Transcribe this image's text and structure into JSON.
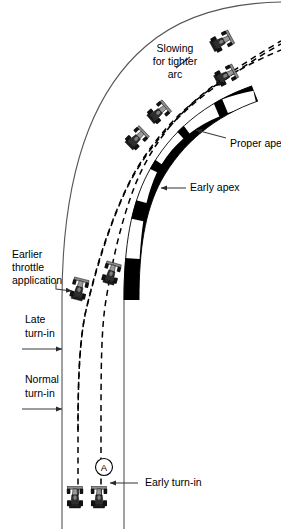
{
  "diagram": {
    "type": "technical-illustration",
    "background_color": "#ffffff",
    "line_color": "#000000",
    "track_edge_color": "#55545a"
  },
  "labels": {
    "slowing": {
      "line1": "Slowing",
      "line2": "for tighter",
      "line3": "arc"
    },
    "proper_apex": "Proper apex",
    "early_apex": "Early apex",
    "earlier_throttle": {
      "line1": "Earlier",
      "line2": "throttle",
      "line3": "application"
    },
    "late_turn_in": {
      "line1": "Late",
      "line2": "turn-in"
    },
    "normal_turn_in": {
      "line1": "Normal",
      "line2": "turn-in"
    },
    "early_turn_in": "Early turn-in",
    "marker_a": "A"
  },
  "elements": {
    "track_outer_edge": "outer-track-boundary",
    "track_inner_edge": "inner-track-boundary",
    "curb": "checkered-apex-curb",
    "racing_lines": [
      {
        "name": "early-apex-line",
        "style": "dashed"
      },
      {
        "name": "normal-line",
        "style": "dashed"
      },
      {
        "name": "late-apex-line",
        "style": "dashed"
      }
    ],
    "cars": [
      {
        "name": "car-start-left",
        "position": "bottom-left"
      },
      {
        "name": "car-start-right",
        "position": "bottom-right"
      },
      {
        "name": "car-mid-left",
        "position": "mid-left"
      },
      {
        "name": "car-mid-right",
        "position": "mid-right"
      },
      {
        "name": "car-apex-inner",
        "position": "apex-inner"
      },
      {
        "name": "car-apex-outer",
        "position": "apex-outer"
      },
      {
        "name": "car-exit-lower",
        "position": "exit-lower"
      },
      {
        "name": "car-exit-upper",
        "position": "exit-upper"
      }
    ]
  }
}
